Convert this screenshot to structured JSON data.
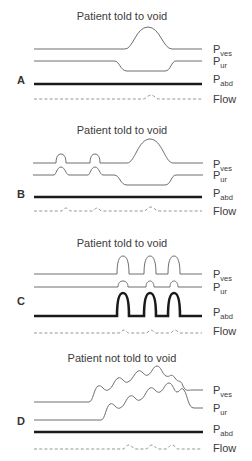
{
  "figure": {
    "panels": [
      {
        "id": "A",
        "title": "Patient told to void",
        "traces": {
          "ves": "P",
          "ves_sub": "ves",
          "ur": "P",
          "ur_sub": "ur",
          "abd": "P",
          "abd_sub": "abd",
          "flow": "Flow"
        }
      },
      {
        "id": "B",
        "title": "Patient told to void",
        "traces": {
          "ves": "P",
          "ves_sub": "ves",
          "ur": "P",
          "ur_sub": "ur",
          "abd": "P",
          "abd_sub": "abd",
          "flow": "Flow"
        }
      },
      {
        "id": "C",
        "title": "Patient told to void",
        "traces": {
          "ves": "P",
          "ves_sub": "ves",
          "ur": "P",
          "ur_sub": "ur",
          "abd": "P",
          "abd_sub": "abd",
          "flow": "Flow"
        }
      },
      {
        "id": "D",
        "title": "Patient not told to void",
        "traces": {
          "ves": "P",
          "ves_sub": "ves",
          "ur": "P",
          "ur_sub": "ur",
          "abd": "P",
          "abd_sub": "abd",
          "flow": "Flow"
        }
      }
    ],
    "colors": {
      "thin_trace": "#6e6e6e",
      "abd_trace": "#1a1a1a",
      "flow_trace": "#8a8a8a",
      "text": "#3c3c3c"
    }
  }
}
